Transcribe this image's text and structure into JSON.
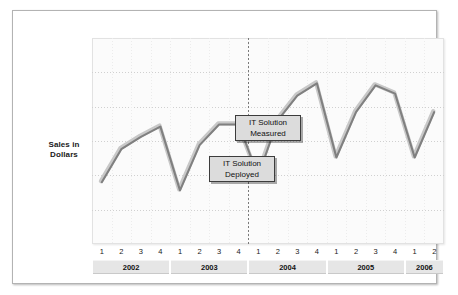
{
  "axis_label": {
    "line1": "Sales in",
    "line2": "Dollars"
  },
  "annotations": [
    {
      "name": "it-solution-measured",
      "line1": "IT Solution",
      "line2": "Measured",
      "box": {
        "x": 222,
        "y": 104,
        "w": 66,
        "h": 26
      },
      "anchor_index": 9
    },
    {
      "name": "it-solution-deployed",
      "line1": "IT Solution",
      "line2": "Deployed",
      "box": {
        "x": 196,
        "y": 145,
        "w": 66,
        "h": 26
      },
      "anchor_index": 8
    }
  ],
  "colors": {
    "line": "#808080",
    "line_highlight": "#c8c8c8",
    "marker": "#555555",
    "grid": "#d0d0d0",
    "plot_bg": "#fbfbfb",
    "frame": "#b3b3b3",
    "band": "#e6e6e6",
    "callout_bg": "#dcdcdc",
    "callout_border": "#3c3c3c"
  },
  "chart_data": {
    "type": "line",
    "title": "",
    "xlabel": "",
    "ylabel": "Sales in Dollars",
    "grid": true,
    "legend": "none",
    "ylim": [
      0,
      100
    ],
    "yticks_count": 6,
    "years": [
      {
        "year": "2002",
        "quarters": [
          "1",
          "2",
          "3",
          "4"
        ]
      },
      {
        "year": "2003",
        "quarters": [
          "1",
          "2",
          "3",
          "4"
        ]
      },
      {
        "year": "2004",
        "quarters": [
          "1",
          "2",
          "3",
          "4"
        ]
      },
      {
        "year": "2005",
        "quarters": [
          "1",
          "2",
          "3",
          "4"
        ]
      },
      {
        "year": "2006",
        "quarters": [
          "1",
          "2"
        ]
      }
    ],
    "x": [
      "2002 1",
      "2002 2",
      "2002 3",
      "2002 4",
      "2003 1",
      "2003 2",
      "2003 3",
      "2003 4",
      "2004 1",
      "2004 2",
      "2004 3",
      "2004 4",
      "2005 1",
      "2005 2",
      "2005 3",
      "2005 4",
      "2006 1",
      "2006 2"
    ],
    "categories": [
      "1",
      "2",
      "3",
      "4",
      "1",
      "2",
      "3",
      "4",
      "1",
      "2",
      "3",
      "4",
      "1",
      "2",
      "3",
      "4",
      "1",
      "2"
    ],
    "series": [
      {
        "name": "Sales",
        "values": [
          30,
          46,
          52,
          57,
          26,
          48,
          58,
          58,
          33,
          60,
          72,
          78,
          42,
          64,
          77,
          73,
          42,
          64
        ]
      }
    ],
    "markers": [
      {
        "index": 8,
        "label": "IT Solution Deployed"
      },
      {
        "index": 9,
        "label": "IT Solution Measured"
      }
    ],
    "event_divider": {
      "index": 8,
      "label": "IT Solution Deployed"
    }
  }
}
